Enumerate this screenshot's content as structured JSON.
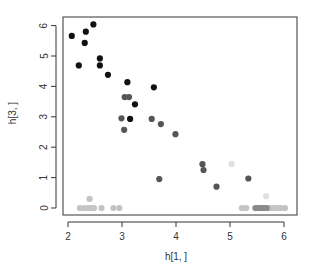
{
  "chart_data": {
    "type": "scatter",
    "title": "",
    "xlabel": "h[1, ]",
    "ylabel": "h[3, ]",
    "xlim": [
      1.9,
      6.25
    ],
    "ylim": [
      -0.22,
      6.3
    ],
    "xticks": [
      2,
      3,
      4,
      5,
      6
    ],
    "yticks": [
      0,
      1,
      2,
      3,
      4,
      5,
      6
    ],
    "grid": false,
    "legend": null,
    "series": [
      {
        "name": "black",
        "color": "#111111",
        "points": [
          [
            2.07,
            5.66
          ],
          [
            2.33,
            5.8
          ],
          [
            2.47,
            6.04
          ],
          [
            2.31,
            5.43
          ],
          [
            2.2,
            4.69
          ],
          [
            2.59,
            4.92
          ],
          [
            2.59,
            4.69
          ],
          [
            2.74,
            4.38
          ],
          [
            3.1,
            4.14
          ],
          [
            3.59,
            3.97
          ],
          [
            3.24,
            3.41
          ],
          [
            3.15,
            2.93
          ]
        ]
      },
      {
        "name": "dark gray",
        "color": "#555555",
        "points": [
          [
            3.05,
            3.65
          ],
          [
            3.13,
            3.65
          ],
          [
            2.99,
            2.95
          ],
          [
            3.04,
            2.57
          ],
          [
            3.55,
            2.93
          ],
          [
            3.72,
            2.76
          ],
          [
            3.99,
            2.43
          ],
          [
            4.49,
            1.44
          ],
          [
            4.51,
            1.25
          ],
          [
            3.69,
            0.95
          ],
          [
            4.75,
            0.7
          ],
          [
            5.34,
            0.97
          ]
        ]
      },
      {
        "name": "medium gray",
        "color": "#8a8a8a",
        "points": [
          [
            5.47,
            0
          ],
          [
            5.52,
            0
          ],
          [
            5.56,
            0
          ],
          [
            5.6,
            0
          ],
          [
            5.64,
            0
          ],
          [
            5.68,
            0
          ]
        ]
      },
      {
        "name": "light gray",
        "color": "#c4c4c4",
        "points": [
          [
            2.22,
            0
          ],
          [
            2.3,
            0
          ],
          [
            2.37,
            0
          ],
          [
            2.43,
            0
          ],
          [
            2.48,
            0
          ],
          [
            2.62,
            0
          ],
          [
            2.84,
            0
          ],
          [
            2.95,
            0
          ],
          [
            2.4,
            0.3
          ],
          [
            5.22,
            0
          ],
          [
            5.3,
            0
          ],
          [
            5.73,
            0
          ],
          [
            5.79,
            0
          ],
          [
            5.87,
            0
          ],
          [
            5.95,
            0
          ],
          [
            6.02,
            0
          ]
        ]
      },
      {
        "name": "very light gray",
        "color": "#e0e0e0",
        "points": [
          [
            5.03,
            1.45
          ],
          [
            5.67,
            0.39
          ],
          [
            5.84,
            0
          ],
          [
            5.91,
            0
          ]
        ]
      }
    ]
  }
}
